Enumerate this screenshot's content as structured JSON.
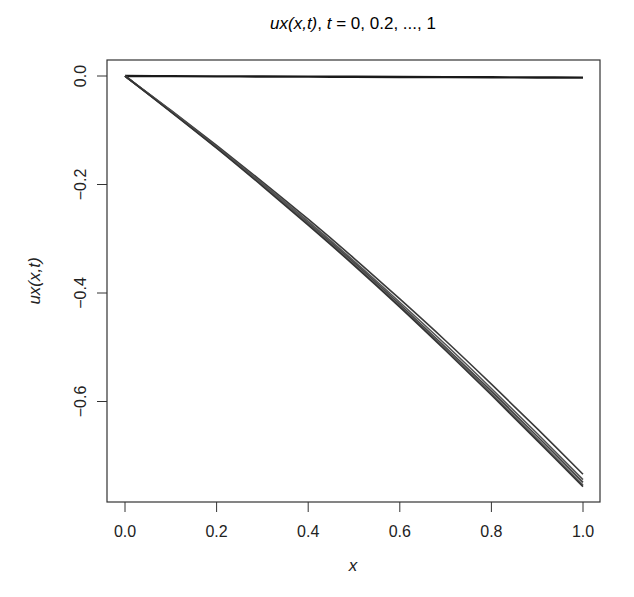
{
  "chart_data": {
    "type": "line",
    "title": "ux(x,t), t = 0, 0.2, ..., 1",
    "title_parts": {
      "fn": "ux(x,t)",
      "sep": ", ",
      "tvar": "t",
      "rest": " = 0, 0.2, ..., 1"
    },
    "xlabel": "x",
    "ylabel": "ux(x,t)",
    "xlim": [
      -0.04,
      1.04
    ],
    "ylim": [
      -0.78,
      0.03
    ],
    "xticks": [
      0.0,
      0.2,
      0.4,
      0.6,
      0.8,
      1.0
    ],
    "xtick_labels": [
      "0.0",
      "0.2",
      "0.4",
      "0.6",
      "0.8",
      "1.0"
    ],
    "yticks": [
      0.0,
      -0.2,
      -0.4,
      -0.6
    ],
    "ytick_labels": [
      "0.0",
      "−0.2",
      "−0.4",
      "−0.6"
    ],
    "grid": false,
    "legend": null,
    "x": [
      0.0,
      0.1,
      0.2,
      0.3,
      0.4,
      0.5,
      0.6,
      0.7,
      0.8,
      0.9,
      1.0
    ],
    "series": [
      {
        "name": "t = 0",
        "color": "#1a1a1a",
        "values": [
          0,
          -0.0003,
          -0.0006,
          -0.0009,
          -0.0012,
          -0.0015,
          -0.0018,
          -0.0021,
          -0.0024,
          -0.0027,
          -0.003
        ]
      },
      {
        "name": "t = 0.2",
        "color": "#3a3a3a",
        "values": [
          0,
          -0.063,
          -0.128,
          -0.195,
          -0.264,
          -0.336,
          -0.411,
          -0.488,
          -0.568,
          -0.65,
          -0.734
        ]
      },
      {
        "name": "t = 0.4",
        "color": "#555555",
        "values": [
          0,
          -0.064,
          -0.13,
          -0.198,
          -0.268,
          -0.341,
          -0.417,
          -0.495,
          -0.576,
          -0.659,
          -0.744
        ]
      },
      {
        "name": "t = 0.6",
        "color": "#444444",
        "values": [
          0,
          -0.065,
          -0.131,
          -0.2,
          -0.271,
          -0.344,
          -0.421,
          -0.5,
          -0.581,
          -0.664,
          -0.749
        ]
      },
      {
        "name": "t = 0.8",
        "color": "#5a5a5a",
        "values": [
          0,
          -0.065,
          -0.132,
          -0.201,
          -0.273,
          -0.347,
          -0.424,
          -0.503,
          -0.585,
          -0.669,
          -0.754
        ]
      },
      {
        "name": "t = 1",
        "color": "#333333",
        "values": [
          0,
          -0.066,
          -0.133,
          -0.203,
          -0.275,
          -0.349,
          -0.426,
          -0.506,
          -0.588,
          -0.672,
          -0.757
        ]
      }
    ]
  }
}
